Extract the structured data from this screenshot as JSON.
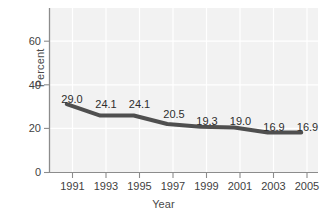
{
  "chart_data": {
    "type": "line",
    "title": "",
    "xlabel": "Year",
    "ylabel": "Percent",
    "categories": [
      "1991",
      "1993",
      "1995",
      "1997",
      "1999",
      "2001",
      "2003",
      "2005"
    ],
    "x": [
      1991,
      1993,
      1995,
      1997,
      1999,
      2001,
      2003,
      2005
    ],
    "values": [
      29.0,
      24.1,
      24.1,
      20.5,
      19.3,
      19.0,
      16.9,
      16.9
    ],
    "point_labels": [
      "29.0",
      "24.1",
      "24.1",
      "20.5",
      "19.3",
      "19.0",
      "16.9",
      "16.9"
    ],
    "ylim": [
      0,
      70
    ],
    "xlim": [
      1990,
      2006
    ],
    "yticks": [
      0,
      20,
      40,
      60
    ],
    "ytick_labels": [
      "0",
      "20",
      "40",
      "60"
    ],
    "xtick_labels": [
      "1991",
      "1993",
      "1995",
      "1997",
      "1999",
      "2001",
      "2003",
      "2005"
    ],
    "grid": true,
    "legend": "none",
    "series": [
      {
        "name": "Percent",
        "values": [
          29.0,
          24.1,
          24.1,
          20.5,
          19.3,
          19.0,
          16.9,
          16.9
        ]
      }
    ],
    "colors": {
      "line": "#4f4f4f",
      "plot_background": "#f2f2f2",
      "grid": "#ffffff",
      "axis": "#8c8c8c",
      "tick_text": "#3f3f3f",
      "label_text": "#4a4a4a",
      "page_background": "#ffffff"
    }
  }
}
